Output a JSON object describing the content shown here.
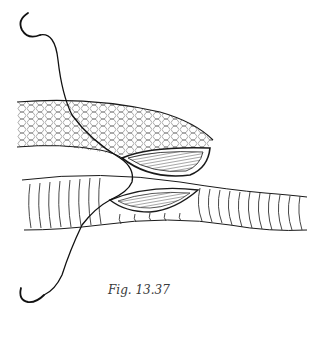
{
  "figure": {
    "caption": "Fig. 13.37",
    "elements": {
      "upper_vessel": "graft-vessel-with-mesh-texture",
      "lower_vessel": "artery-with-ring-texture",
      "upper_incision": "opened-arteriotomy-upper",
      "lower_incision": "opened-arteriotomy-lower",
      "suture": "double-armed-suture",
      "needles": [
        "needle-top",
        "needle-bottom"
      ]
    },
    "colors": {
      "ink": "#1a1a1a",
      "background": "#ffffff"
    }
  }
}
